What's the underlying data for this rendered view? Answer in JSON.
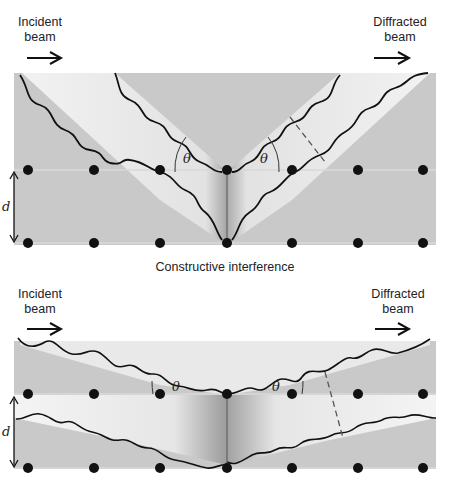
{
  "panels": [
    {
      "incident_label_1": "Incident",
      "incident_label_2": "beam",
      "diffracted_label_1": "Diffracted",
      "diffracted_label_2": "beam",
      "angle_symbol": "θ",
      "spacing_symbol": "d"
    },
    {
      "incident_label_1": "Incident",
      "incident_label_2": "beam",
      "diffracted_label_1": "Diffracted",
      "diffracted_label_2": "beam",
      "angle_symbol": "θ",
      "spacing_symbol": "d"
    }
  ],
  "captions": {
    "top": "Constructive interference"
  },
  "colors": {
    "background": "#ffffff",
    "crystal": "#c8c8c8",
    "beam_band": "#eeeeee",
    "atoms": "#111111",
    "wave": "#111111"
  }
}
